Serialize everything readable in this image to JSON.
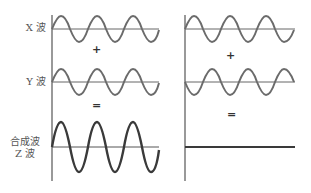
{
  "labels": {
    "x_wave": "X 波",
    "y_wave": "Y 波",
    "z_wave_line1": "合成波",
    "z_wave_line2": "Z 波"
  },
  "operators": {
    "plus": "+",
    "equals": "="
  },
  "panels": [
    {
      "name": "constructive-interference",
      "x_wave": {
        "phase": "in-phase",
        "amplitude": 1,
        "cycles": 3
      },
      "y_wave": {
        "phase": "in-phase",
        "amplitude": 1,
        "cycles": 3
      },
      "z_wave": {
        "result": "amplified",
        "amplitude": 2,
        "cycles": 3
      }
    },
    {
      "name": "destructive-interference",
      "x_wave": {
        "phase": "0",
        "amplitude": 1,
        "cycles": 3
      },
      "y_wave": {
        "phase": "180-degree-shift",
        "amplitude": 1,
        "cycles": 3
      },
      "z_wave": {
        "result": "cancelled",
        "amplitude": 0
      }
    }
  ],
  "colors": {
    "wave": "#6b6b6b",
    "z_wave": "#3a3a3a",
    "axis": "#555555",
    "text": "#555555"
  }
}
